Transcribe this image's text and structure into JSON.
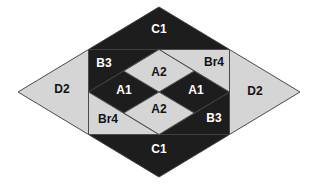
{
  "figure": {
    "colors": {
      "dark_fill": "#1d1d1d",
      "light_fill": "#d5d5d5",
      "seam_on_dark": "#3f3f3f",
      "seam_on_light": "#4a4a4a",
      "background": "#ffffff",
      "text_on_dark": "#ffffff",
      "text_on_light": "#121212"
    },
    "pieces": [
      {
        "id": "c1-top",
        "label": "C1",
        "shade": "dark",
        "shape": "triangle"
      },
      {
        "id": "c1-bottom",
        "label": "C1",
        "shade": "dark",
        "shape": "triangle"
      },
      {
        "id": "d2-left",
        "label": "D2",
        "shade": "light",
        "shape": "triangle"
      },
      {
        "id": "d2-right",
        "label": "D2",
        "shade": "light",
        "shape": "triangle"
      },
      {
        "id": "b3-top-left",
        "label": "B3",
        "shade": "dark",
        "shape": "triangle"
      },
      {
        "id": "br4-top-right",
        "label": "Br4",
        "shade": "light",
        "shape": "triangle"
      },
      {
        "id": "br4-bottom-left",
        "label": "Br4",
        "shade": "light",
        "shape": "triangle"
      },
      {
        "id": "b3-bottom-right",
        "label": "B3",
        "shade": "dark",
        "shape": "triangle"
      },
      {
        "id": "a2-top",
        "label": "A2",
        "shade": "light",
        "shape": "diamond"
      },
      {
        "id": "a2-bottom",
        "label": "A2",
        "shade": "light",
        "shape": "diamond"
      },
      {
        "id": "a1-left",
        "label": "A1",
        "shade": "dark",
        "shape": "diamond"
      },
      {
        "id": "a1-right",
        "label": "A1",
        "shade": "dark",
        "shape": "diamond"
      }
    ]
  }
}
